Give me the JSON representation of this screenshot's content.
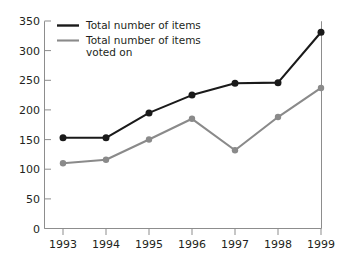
{
  "chart_data": {
    "type": "line",
    "title": "",
    "xlabel": "",
    "ylabel": "",
    "categories": [
      "1993",
      "1994",
      "1995",
      "1996",
      "1997",
      "1998",
      "1999"
    ],
    "x": [
      1993,
      1994,
      1995,
      1996,
      1997,
      1998,
      1999
    ],
    "series": [
      {
        "name": "Total number of items",
        "color": "#1a1a1a",
        "values": [
          153,
          153,
          195,
          225,
          245,
          246,
          331
        ]
      },
      {
        "name": "Total number of items voted on",
        "color": "#8a8a8a",
        "values": [
          110,
          116,
          150,
          185,
          132,
          188,
          237
        ]
      }
    ],
    "ylim": [
      0,
      350
    ],
    "ytick_labels": [
      "0",
      "50",
      "100",
      "150",
      "200",
      "250",
      "300",
      "350"
    ],
    "ytick_values": [
      0,
      50,
      100,
      150,
      200,
      250,
      300,
      350
    ],
    "grid": false,
    "legend_position": "top-left",
    "legend": [
      {
        "label_line1": "Total number of items",
        "label_line2": "",
        "color": "#1a1a1a"
      },
      {
        "label_line1": "Total number of items",
        "label_line2": "voted on",
        "color": "#8a8a8a"
      }
    ]
  },
  "colors": {
    "dark_series": "#1a1a1a",
    "grey_series": "#8a8a8a",
    "axis": "#8d8d8d",
    "text": "#231f20",
    "background": "#ffffff"
  }
}
